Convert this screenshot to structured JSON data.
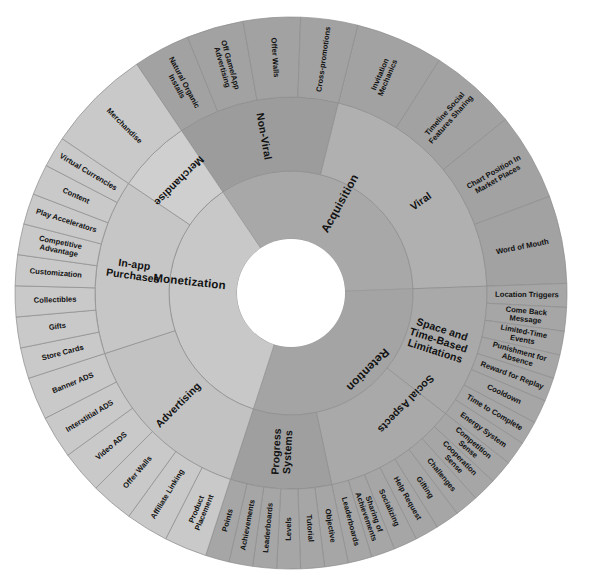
{
  "figure": {
    "type": "sunburst",
    "center_hole_label": "",
    "background_color": "#ffffff",
    "center": {
      "x": 291,
      "y": 293
    },
    "radii": {
      "hole": 54,
      "ring1_outer": 122,
      "ring2_outer": 196,
      "ring3_outer": 276
    }
  },
  "colors": {
    "acquisition": "#a8a8a8",
    "acquisition_ring2_viral": "#b0b0b0",
    "acquisition_ring2_nonviral": "#9c9c9c",
    "acquisition_ring3": "#a2a2a2",
    "retention": "#a4a4a4",
    "retention_ring2_social": "#a9a9a9",
    "retention_ring2_progress": "#9f9f9f",
    "retention_ring3": "#a6a6a6",
    "monetization": "#c8c8c8",
    "monetization_ring2_merch": "#cfcfcf",
    "monetization_ring2_iap": "#c6c6c6",
    "monetization_ring2_ads": "#c2c2c2",
    "monetization_ring3": "#c9c9c9",
    "stroke": "#8d8d8d",
    "text": "#111111"
  },
  "chart_data": {
    "type": "pie",
    "levels": 3,
    "nodes": [
      {
        "level1": "Acquisition",
        "start_angle": -90,
        "end_angle": 53,
        "children": [
          {
            "level2": "Viral",
            "start_angle": -90,
            "end_angle": -14,
            "children": [
              "Invitation Mechanics",
              "Timeline Social Features Sharing",
              "Chart Position In Market Places",
              "Word of Mouth"
            ]
          },
          {
            "level2": "Non-Viral",
            "start_angle": -14,
            "end_angle": 53,
            "children": [
              "Cross-promotions",
              "Offer Walls",
              "Off Game/App Advertising",
              "Natural Organic Installs"
            ]
          }
        ]
      },
      {
        "level1": "Retention",
        "start_angle": -90,
        "end_angle": -270,
        "direction": "counter-clockwise-from-top",
        "children": [
          {
            "level2": "Space and Time-Based Limitations",
            "children": [
              "Location Triggers",
              "Come Back Message",
              "Limited-Time Events",
              "Punishment for Absence",
              "Reward for Replay",
              "Cooldown",
              "Time to Complete",
              "Energy System"
            ]
          },
          {
            "level2": "Social Aspects",
            "children": [
              "Competition Sense",
              "Cooperation Sense",
              "Challenges",
              "Gifting",
              "Help Request",
              "Socializing",
              "Sharing of Achievements",
              "Leaderboards"
            ]
          },
          {
            "level2": "Progress Systems",
            "children": [
              "Objective",
              "Tutorial",
              "Levels",
              "Leaderboards",
              "Achievements",
              "Points"
            ]
          }
        ]
      },
      {
        "level1": "Monetization",
        "children": [
          {
            "level2": "Advertising",
            "children": [
              "Product Placement",
              "Affiliate Linking",
              "Offer Walls",
              "Video ADS",
              "Interstitial ADS",
              "Banner ADS"
            ]
          },
          {
            "level2": "In-app Purchases",
            "children": [
              "Store Cards",
              "Gifts",
              "Collectibles",
              "Customization",
              "Competitive Advantage",
              "Play Accelerators",
              "Content",
              "Virtual Currencies"
            ]
          },
          {
            "level2": "Merchandise",
            "children": [
              "Merchandise"
            ]
          }
        ]
      }
    ]
  },
  "segments": {
    "ring1": [
      {
        "id": "acquisition",
        "label": "Acquisition",
        "a0": -90,
        "a1": 53,
        "fill": "#a8a8a8"
      },
      {
        "id": "retention",
        "label": "Retention",
        "a0": 53,
        "a1": 208,
        "fill": "#a4a4a4"
      },
      {
        "id": "monetization",
        "label": "Monetization",
        "a0": 208,
        "a1": 270,
        "fill": "#c8c8c8"
      }
    ],
    "ring2": [
      {
        "id": "viral",
        "label": "Viral",
        "a0": -90,
        "a1": -14,
        "fill": "#b0b0b0"
      },
      {
        "id": "non-viral",
        "label": "Non-Viral",
        "a0": -14,
        "a1": 53,
        "fill": "#9c9c9c"
      },
      {
        "id": "space-time",
        "label": "Space and Time-Based Limitations",
        "a0": -90,
        "a1": -22,
        "fill": "#a9a9a9"
      },
      {
        "id": "social-aspects",
        "label": "Social Aspects",
        "a0": -22,
        "a1": 58,
        "fill": "#a9a9a9"
      },
      {
        "id": "progress-systems",
        "label": "Progress Systems",
        "a0": 58,
        "a1": 110,
        "fill": "#9f9f9f"
      },
      {
        "id": "advertising",
        "label": "Advertising",
        "a0": 110,
        "a1": 178,
        "fill": "#c2c2c2"
      },
      {
        "id": "in-app-purchases",
        "label": "In-app Purchases",
        "a0": 178,
        "a1": 248,
        "fill": "#c6c6c6"
      },
      {
        "id": "merchandise",
        "label": "Merchandise",
        "a0": 248,
        "a1": 270,
        "fill": "#cfcfcf"
      }
    ],
    "ring3_acquisition": [
      "Invitation Mechanics",
      "Timeline Social Features Sharing",
      "Chart Position In Market Places",
      "Word of Mouth",
      "Cross-promotions",
      "Offer Walls",
      "Off Game/App Advertising",
      "Natural Organic Installs"
    ],
    "ring3_retention": [
      "Location Triggers",
      "Come Back Message",
      "Limited-Time Events",
      "Punishment for Absence",
      "Reward for Replay",
      "Cooldown",
      "Time to Complete",
      "Energy System",
      "Competition Sense",
      "Cooperation Sense",
      "Challenges",
      "Gifting",
      "Help Request",
      "Socializing",
      "Sharing of Achievements",
      "Leaderboards",
      "Objective",
      "Tutorial",
      "Levels",
      "Leaderboards",
      "Achievements",
      "Points"
    ],
    "ring3_monetization": [
      "Product Placement",
      "Affiliate Linking",
      "Offer Walls",
      "Video ADS",
      "Interstitial ADS",
      "Banner ADS",
      "Store Cards",
      "Gifts",
      "Collectibles",
      "Customization",
      "Competitive Advantage",
      "Play Accelerators",
      "Content",
      "Virtual Currencies",
      "Merchandise"
    ]
  }
}
